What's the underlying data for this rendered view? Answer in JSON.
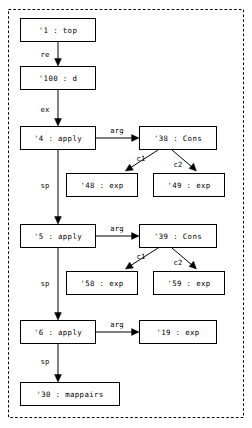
{
  "diagram": {
    "background_color": "#ffffff",
    "line_color": "#000000",
    "cluster": {
      "label": "",
      "style": "dashed",
      "x": 8,
      "y": 9,
      "width": 236,
      "height": 409
    },
    "nodes": [
      {
        "id": "n1",
        "label": "'1 : top",
        "x": 20,
        "y": 18,
        "w": 76,
        "h": 24
      },
      {
        "id": "n100",
        "label": "'100  : d",
        "x": 20,
        "y": 66,
        "w": 76,
        "h": 24
      },
      {
        "id": "n4",
        "label": "'4 : apply",
        "x": 20,
        "y": 126,
        "w": 76,
        "h": 24
      },
      {
        "id": "n38",
        "label": "'38 : Cons",
        "x": 139,
        "y": 126,
        "w": 78,
        "h": 24
      },
      {
        "id": "n48",
        "label": "'48 : exp",
        "x": 66,
        "y": 173,
        "w": 72,
        "h": 24
      },
      {
        "id": "n49",
        "label": "'49 : exp",
        "x": 153,
        "y": 173,
        "w": 72,
        "h": 24
      },
      {
        "id": "n5",
        "label": "'5 : apply",
        "x": 20,
        "y": 224,
        "w": 76,
        "h": 24
      },
      {
        "id": "n39",
        "label": "'39 : Cons",
        "x": 139,
        "y": 224,
        "w": 78,
        "h": 24
      },
      {
        "id": "n58",
        "label": "'58 : exp",
        "x": 66,
        "y": 271,
        "w": 72,
        "h": 24
      },
      {
        "id": "n59",
        "label": "'59 : exp",
        "x": 153,
        "y": 271,
        "w": 72,
        "h": 24
      },
      {
        "id": "n6",
        "label": "'6 : apply",
        "x": 20,
        "y": 320,
        "w": 76,
        "h": 24
      },
      {
        "id": "n19",
        "label": "'19 : exp",
        "x": 139,
        "y": 320,
        "w": 78,
        "h": 24
      },
      {
        "id": "n30",
        "label": "'30 : mappairs",
        "x": 20,
        "y": 382,
        "w": 100,
        "h": 24
      }
    ],
    "edges": [
      {
        "id": "e1",
        "from": "n1",
        "to": "n100",
        "label": "re",
        "label_x": 45,
        "label_y": 55
      },
      {
        "id": "e2",
        "from": "n100",
        "to": "n4",
        "label": "ex",
        "label_x": 45,
        "label_y": 110
      },
      {
        "id": "e3",
        "from": "n4",
        "to": "n38",
        "label": "arg",
        "label_x": 117,
        "label_y": 131
      },
      {
        "id": "e4",
        "from": "n38",
        "to": "n48",
        "label": "c1",
        "label_x": 141,
        "label_y": 159
      },
      {
        "id": "e5",
        "from": "n38",
        "to": "n49",
        "label": "c2",
        "label_x": 178,
        "label_y": 165
      },
      {
        "id": "e6",
        "from": "n4",
        "to": "n5",
        "label": "sp",
        "label_x": 45,
        "label_y": 186
      },
      {
        "id": "e7",
        "from": "n5",
        "to": "n39",
        "label": "arg",
        "label_x": 117,
        "label_y": 229
      },
      {
        "id": "e8",
        "from": "n39",
        "to": "n58",
        "label": "c1",
        "label_x": 141,
        "label_y": 257
      },
      {
        "id": "e9",
        "from": "n39",
        "to": "n59",
        "label": "c2",
        "label_x": 178,
        "label_y": 263
      },
      {
        "id": "e10",
        "from": "n5",
        "to": "n6",
        "label": "sp",
        "label_x": 45,
        "label_y": 284
      },
      {
        "id": "e11",
        "from": "n6",
        "to": "n19",
        "label": "arg",
        "label_x": 117,
        "label_y": 325
      },
      {
        "id": "e12",
        "from": "n6",
        "to": "n30",
        "label": "sp",
        "label_x": 45,
        "label_y": 362
      }
    ]
  }
}
